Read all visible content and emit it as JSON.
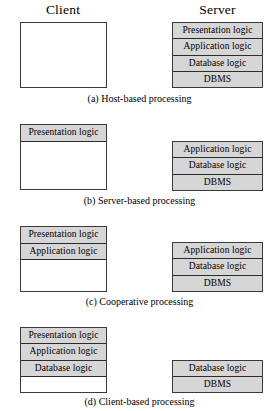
{
  "figure": {
    "headings": {
      "client": "Client",
      "server": "Server"
    },
    "sections": [
      {
        "id": "a",
        "caption": "(a) Host-based processing",
        "client": {
          "rows": [
            {
              "label": "",
              "filled": false
            },
            {
              "label": "",
              "filled": false
            },
            {
              "label": "",
              "filled": false
            },
            {
              "label": "",
              "filled": false
            }
          ]
        },
        "server": {
          "rows": [
            {
              "label": "Presentation logic",
              "filled": true
            },
            {
              "label": "Application logic",
              "filled": true
            },
            {
              "label": "Database logic",
              "filled": true
            },
            {
              "label": "DBMS",
              "filled": true
            }
          ]
        }
      },
      {
        "id": "b",
        "caption": "(b) Server-based processing",
        "client": {
          "rows": [
            {
              "label": "Presentation logic",
              "filled": true
            },
            {
              "label": "",
              "filled": false
            },
            {
              "label": "",
              "filled": false
            },
            {
              "label": "",
              "filled": false
            }
          ]
        },
        "server": {
          "rows": [
            {
              "label": "Application logic",
              "filled": true
            },
            {
              "label": "Database logic",
              "filled": true
            },
            {
              "label": "DBMS",
              "filled": true
            }
          ]
        }
      },
      {
        "id": "c",
        "caption": "(c) Cooperative processing",
        "client": {
          "rows": [
            {
              "label": "Presentation logic",
              "filled": true
            },
            {
              "label": "Application logic",
              "filled": true
            },
            {
              "label": "",
              "filled": false
            },
            {
              "label": "",
              "filled": false
            }
          ]
        },
        "server": {
          "rows": [
            {
              "label": "Application logic",
              "filled": true
            },
            {
              "label": "Database logic",
              "filled": true
            },
            {
              "label": "DBMS",
              "filled": true
            }
          ]
        }
      },
      {
        "id": "d",
        "caption": "(d) Client-based processing",
        "client": {
          "rows": [
            {
              "label": "Presentation logic",
              "filled": true
            },
            {
              "label": "Application logic",
              "filled": true
            },
            {
              "label": "Database logic",
              "filled": true
            },
            {
              "label": "",
              "filled": false
            }
          ]
        },
        "server": {
          "rows": [
            {
              "label": "Database logic",
              "filled": true
            },
            {
              "label": "DBMS",
              "filled": true
            }
          ]
        }
      }
    ],
    "colors": {
      "filled_fill": "#d6d6d6",
      "box_border": "#3a3a3a",
      "row_rule": "#2c2c2c",
      "background": "#ffffff",
      "text": "#000000"
    }
  }
}
